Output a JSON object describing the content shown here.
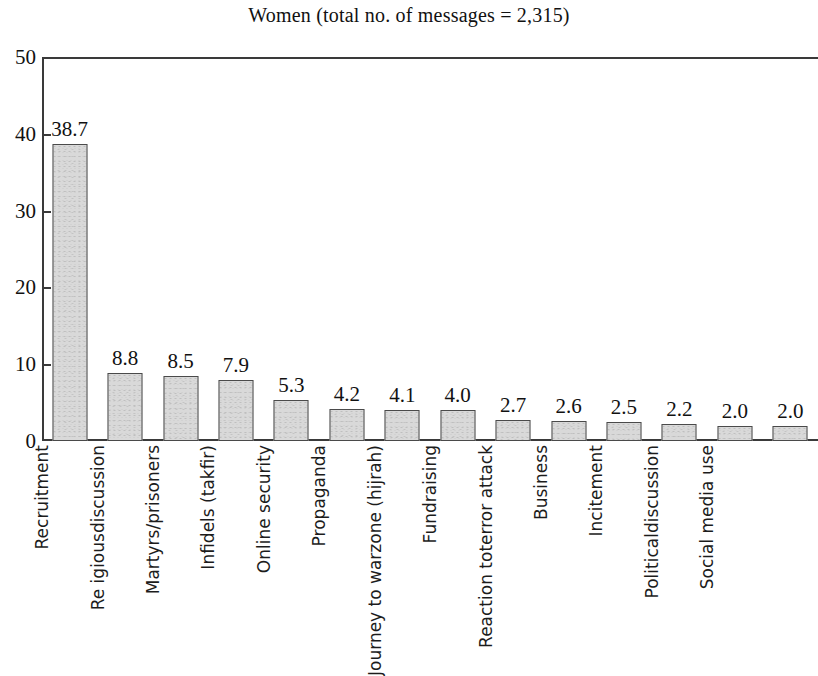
{
  "chart_data": {
    "type": "bar",
    "title": "Women (total no. of messages = 2,315)",
    "xlabel": "",
    "ylabel": "",
    "ylim": [
      0,
      50
    ],
    "yticks": [
      0,
      10,
      20,
      30,
      40,
      50
    ],
    "grid": false,
    "legend": "none",
    "total_messages": "2,315",
    "group": "Women",
    "categories": [
      "Personal issues",
      "Recruitment",
      "Re igious discussion",
      "Martyrs/prisoners",
      "Infidels (takfir)",
      "Online security",
      "Propaganda",
      "Journey to war zone (hijrah)",
      "Fundraising",
      "Reaction to terror attack",
      "Business",
      "Incitement",
      "Political discussion",
      "Social media use"
    ],
    "category_lines": [
      [
        "Personal issues"
      ],
      [
        "Recruitment"
      ],
      [
        "Re igious",
        "discussion"
      ],
      [
        "Martyrs/prisoners"
      ],
      [
        "Infidels (takfir)"
      ],
      [
        "Online security"
      ],
      [
        "Propaganda"
      ],
      [
        "Journey to war",
        "zone (hijrah)"
      ],
      [
        "Fundraising"
      ],
      [
        "Reaction to",
        "terror attack"
      ],
      [
        "Business"
      ],
      [
        "Incitement"
      ],
      [
        "Political",
        "discussion"
      ],
      [
        "Social media use"
      ]
    ],
    "values": [
      38.7,
      8.8,
      8.5,
      7.9,
      5.3,
      4.2,
      4.1,
      4.0,
      2.7,
      2.6,
      2.5,
      2.2,
      2.0,
      2.0
    ],
    "value_labels": [
      "38.7",
      "8.8",
      "8.5",
      "7.9",
      "5.3",
      "4.2",
      "4.1",
      "4.0",
      "2.7",
      "2.6",
      "2.5",
      "2.2",
      "2.0",
      "2.0"
    ],
    "ytick_labels": [
      "0",
      "10",
      "20",
      "30",
      "40",
      "50"
    ],
    "colors": {
      "bar_fill": "#d9d9d9",
      "bar_border": "#4a4a4a",
      "axis": "#3a3a3a",
      "text": "#111111",
      "background": "#ffffff"
    }
  }
}
